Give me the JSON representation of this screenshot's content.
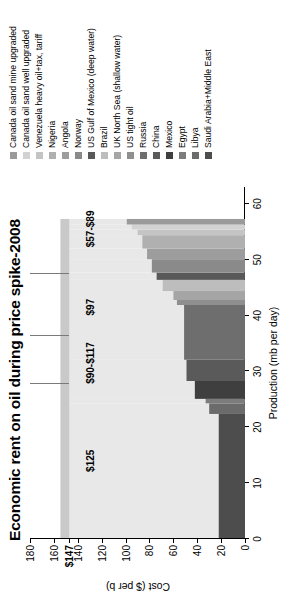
{
  "chart_data": {
    "type": "area",
    "title": "Economic rent on oil during price spike-2008",
    "xlabel": "Production (mb per day)",
    "ylabel": "Cost ($ per b)",
    "xlim": [
      0,
      63
    ],
    "ylim": [
      0,
      180
    ],
    "grid": false,
    "legend_position": "right",
    "xticks": [
      "0",
      "10",
      "20",
      "30",
      "40",
      "50",
      "60"
    ],
    "xtick_values": [
      0,
      10,
      20,
      30,
      40,
      50,
      60
    ],
    "yticks": [
      "0",
      "20",
      "40",
      "60",
      "80",
      "100",
      "120",
      "140",
      "$147",
      "160",
      "180"
    ],
    "ytick_values": [
      0,
      20,
      40,
      60,
      80,
      100,
      120,
      140,
      147,
      160,
      180
    ],
    "ytick_bold": [
      "$147"
    ],
    "market_price_line": 147,
    "annotations": [
      {
        "label": "$125",
        "x": 14.0,
        "y": 130
      },
      {
        "label": "$90-$117",
        "x": 31.5,
        "y": 130
      },
      {
        "label": "$97",
        "x": 41.5,
        "y": 130
      },
      {
        "label": "$57-$89",
        "x": 55.5,
        "y": 130
      }
    ],
    "band_separators": [
      27.8,
      36.3,
      47.5
    ],
    "segments": [
      {
        "name": "Saudi Arabia+Middle East",
        "production": 22.2,
        "cost": 22,
        "color": "#4d4d4d"
      },
      {
        "name": "Libya",
        "production": 1.9,
        "cost": 30,
        "color": "#6b6b6b"
      },
      {
        "name": "Egypt",
        "production": 0.8,
        "cost": 33,
        "color": "#7c7c7c"
      },
      {
        "name": "Mexico",
        "production": 3.2,
        "cost": 42,
        "color": "#3f3f3f"
      },
      {
        "name": "China",
        "production": 3.8,
        "cost": 49,
        "color": "#5a5a5a"
      },
      {
        "name": "Russia",
        "production": 9.8,
        "cost": 51,
        "color": "#6e6e6e"
      },
      {
        "name": "US tight oil",
        "production": 0.9,
        "cost": 57,
        "color": "#8f8f8f"
      },
      {
        "name": "UK North Sea (shallow water)",
        "production": 1.6,
        "cost": 60,
        "color": "#a5a5a5"
      },
      {
        "name": "Brazil",
        "production": 2.0,
        "cost": 69,
        "color": "#bdbdbd"
      },
      {
        "name": "US Gulf of Mexico (deep water)",
        "production": 1.3,
        "cost": 74,
        "color": "#585858"
      },
      {
        "name": "Norway",
        "production": 2.4,
        "cost": 78,
        "color": "#8a8a8a"
      },
      {
        "name": "Angola",
        "production": 1.9,
        "cost": 82,
        "color": "#9d9d9d"
      },
      {
        "name": "Nigeria",
        "production": 2.4,
        "cost": 86,
        "color": "#b0b0b0"
      },
      {
        "name": "Venezuela heavy oil+tax, tariff",
        "production": 1.0,
        "cost": 90,
        "color": "#c4c4c4"
      },
      {
        "name": "Canada oil sand well upgraded",
        "production": 0.9,
        "cost": 95,
        "color": "#d2d2d2"
      },
      {
        "name": "Canada oil sand mine upgraded",
        "production": 1.0,
        "cost": 99,
        "color": "#9a9a9a"
      }
    ],
    "rent_fill_color": "#e8e8e8",
    "cap_band_color": "#c9c9c9"
  },
  "legend": {
    "items": [
      {
        "label": "Canada oil sand mine upgraded",
        "color": "#9a9a9a"
      },
      {
        "label": "Canada oil sand well upgraded",
        "color": "#d2d2d2"
      },
      {
        "label": "Venezuela heavy oil+tax, tariff",
        "color": "#c4c4c4"
      },
      {
        "label": "Nigeria",
        "color": "#b0b0b0"
      },
      {
        "label": "Angola",
        "color": "#9d9d9d"
      },
      {
        "label": "Norway",
        "color": "#8a8a8a"
      },
      {
        "label": "US Gulf of Mexico (deep water)",
        "color": "#585858"
      },
      {
        "label": "Brazil",
        "color": "#bdbdbd"
      },
      {
        "label": "UK North Sea (shallow water)",
        "color": "#a5a5a5"
      },
      {
        "label": "US tight oil",
        "color": "#8f8f8f"
      },
      {
        "label": "Russia",
        "color": "#6e6e6e"
      },
      {
        "label": "China",
        "color": "#5a5a5a"
      },
      {
        "label": "Mexico",
        "color": "#3f3f3f"
      },
      {
        "label": "Egypt",
        "color": "#7c7c7c"
      },
      {
        "label": "Libya",
        "color": "#6b6b6b"
      },
      {
        "label": "Saudi Arabia+Middle East",
        "color": "#4d4d4d"
      }
    ]
  }
}
